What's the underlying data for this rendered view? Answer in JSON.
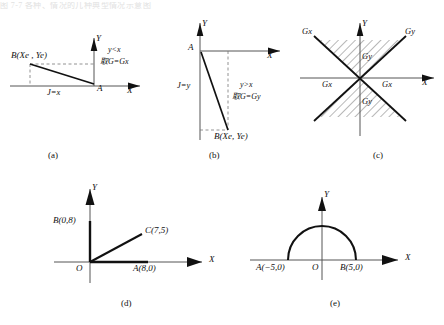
{
  "page": {
    "header_text": "图 7-7  各种、情况的几种典型情况示意图",
    "width": 444,
    "height": 325,
    "ink": "#111111",
    "axis_color": "#555555",
    "dash_color": "#777777"
  },
  "panels": [
    {
      "id": "a",
      "caption": "(a)",
      "axis_x_label": "X",
      "axis_y_label": "Y",
      "labels": {
        "point_b": "B(Xe , Ye)",
        "point_a": "A",
        "j_label": "J=x",
        "condition": "y<x",
        "take": "取G=Gx"
      }
    },
    {
      "id": "b",
      "caption": "(b)",
      "axis_x_label": "X",
      "axis_y_label": "Y",
      "labels": {
        "point_a": "A",
        "point_b": "B(Xe, Ye)",
        "j_label": "J=y",
        "condition": "y>x",
        "take": "取G=Gy"
      }
    },
    {
      "id": "c",
      "caption": "(c)",
      "axis_x_label": "X",
      "axis_y_label": "Y",
      "labels": {
        "top_left": "Gx",
        "top_right": "Gy",
        "upper_center": "Gy",
        "left_center": "Gx",
        "right_center": "Gx",
        "lower_center": "Gy"
      }
    },
    {
      "id": "d",
      "caption": "(d)",
      "axis_x_label": "X",
      "axis_y_label": "Y",
      "labels": {
        "origin": "O",
        "point_b": "B(0,8)",
        "point_c": "C(7,5)",
        "point_a": "A(8,0)"
      }
    },
    {
      "id": "e",
      "caption": "(e)",
      "axis_x_label": "X",
      "axis_y_label": "Y",
      "labels": {
        "point_a": "A(−5,0)",
        "origin": "O",
        "point_b": "B(5,0)"
      }
    }
  ]
}
